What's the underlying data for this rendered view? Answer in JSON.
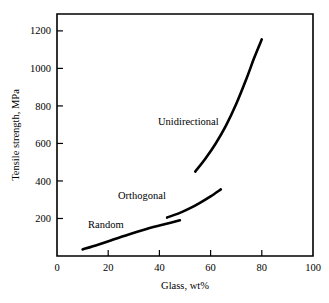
{
  "chart_data": {
    "type": "line",
    "title": "",
    "xlabel": "Glass, wt%",
    "ylabel": "Tensile strength, MPa",
    "xlim": [
      0,
      100
    ],
    "ylim": [
      0,
      1290
    ],
    "grid": false,
    "legend": "inline-labels",
    "xticks": [
      "0",
      "20",
      "40",
      "60",
      "80",
      "100"
    ],
    "xtick_values": [
      0,
      20,
      40,
      60,
      80,
      100
    ],
    "yticks": [
      "200",
      "400",
      "600",
      "800",
      "1000",
      "1200"
    ],
    "ytick_values": [
      200,
      400,
      600,
      800,
      1000,
      1200
    ],
    "series": [
      {
        "name": "Random",
        "label": "Random",
        "points": [
          [
            10,
            35
          ],
          [
            16,
            60
          ],
          [
            22,
            88
          ],
          [
            28,
            115
          ],
          [
            34,
            140
          ],
          [
            40,
            162
          ],
          [
            44,
            176
          ],
          [
            48,
            190
          ]
        ]
      },
      {
        "name": "Orthogonal",
        "label": "Orthogonal",
        "points": [
          [
            43,
            205
          ],
          [
            48,
            230
          ],
          [
            52,
            255
          ],
          [
            56,
            285
          ],
          [
            60,
            318
          ],
          [
            64,
            355
          ]
        ]
      },
      {
        "name": "Unidirectional",
        "label": "Unidirectional",
        "points": [
          [
            54,
            450
          ],
          [
            58,
            520
          ],
          [
            62,
            600
          ],
          [
            66,
            695
          ],
          [
            70,
            810
          ],
          [
            74,
            945
          ],
          [
            77,
            1055
          ],
          [
            80,
            1155
          ]
        ]
      }
    ]
  },
  "labels": {
    "unidirectional": "Unidirectional",
    "orthogonal": "Orthogonal",
    "random": "Random"
  },
  "axes": {
    "x_title": "Glass, wt%",
    "y_title": "Tensile strength, MPa",
    "x_ticks": [
      "0",
      "20",
      "40",
      "60",
      "80",
      "100"
    ],
    "y_ticks": [
      "200",
      "400",
      "600",
      "800",
      "1000",
      "1200"
    ]
  },
  "colors": {
    "curve": "#000000",
    "axis": "#000000",
    "background": "#ffffff"
  }
}
